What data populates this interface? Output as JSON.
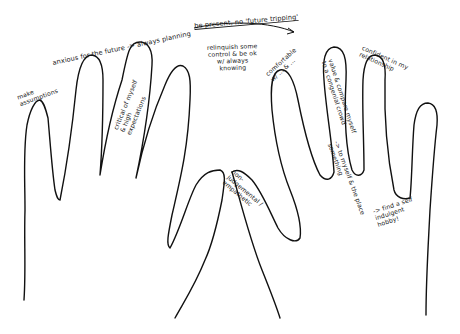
{
  "figure": {
    "stroke_color": "#111111",
    "background": "#ffffff"
  },
  "left_hand": {
    "annotations": {
      "pinky": "make assumptions",
      "arc_top": "anxious for the future -> always planning",
      "ring_finger": "critical of myself & high expectations",
      "thumb": "non-judgemental / empathetic"
    }
  },
  "center": {
    "arrow_top": "be present, no 'future tripping'",
    "middle_note": "relinquish some control & be ok w/ always knowing"
  },
  "right_hand": {
    "annotations": {
      "thumb_side": "comfortable w/ ... & ...",
      "index_finger": "value & compare myself to a congenial crowd",
      "index_arrow": "-> to myself & the place something",
      "middle_tip": "confident in my relationship",
      "palm_arrow": "-> find a self indulgent hobby!"
    }
  }
}
